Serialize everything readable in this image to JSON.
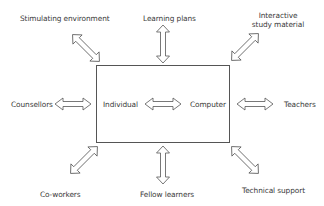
{
  "diagram": {
    "central_box": {
      "left_label": "Individual",
      "right_label": "Computer"
    },
    "nodes": {
      "top_left": "Stimulating environment",
      "top": "Learning plans",
      "top_right_line1": "Interactive",
      "top_right_line2": "study material",
      "left": "Counsellors",
      "right": "Teachers",
      "bottom_left": "Co-workers",
      "bottom": "Fellow learners",
      "bottom_right": "Technical support"
    },
    "connector": "double-headed arrow",
    "colors": {
      "line": "#555555",
      "text": "#3a3a3a",
      "background": "#ffffff"
    }
  }
}
